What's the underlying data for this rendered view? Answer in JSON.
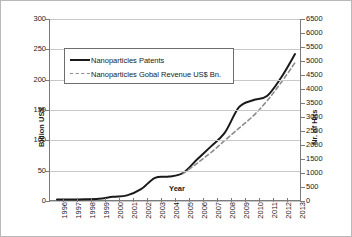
{
  "chart_data": {
    "type": "line",
    "title": "",
    "xlabel": "Year",
    "ylabel": "Billion US$",
    "y2label": "Nr. of Hits",
    "grid": true,
    "legend_position": "upper-left-inside",
    "categories": [
      "1996",
      "1997",
      "1998",
      "1999",
      "2000",
      "2001",
      "2002",
      "2003",
      "2004",
      "2005",
      "2006",
      "2007",
      "2008",
      "2009",
      "2010",
      "2011",
      "2012",
      "2013"
    ],
    "ylim": [
      0,
      300
    ],
    "yticks": [
      0,
      50,
      100,
      150,
      200,
      250,
      300
    ],
    "y2lim": [
      0,
      6500
    ],
    "y2ticks": [
      0,
      500,
      1000,
      1500,
      2000,
      2500,
      3000,
      3500,
      4000,
      4500,
      5000,
      5500,
      6000,
      6500
    ],
    "series": [
      {
        "name": "Nanoparticles Patents",
        "axis": "right",
        "units": "Nr. of Hits",
        "style": "solid",
        "color": "#1a1a1a",
        "values": [
          50,
          55,
          60,
          80,
          150,
          200,
          420,
          830,
          870,
          1000,
          1480,
          1950,
          2450,
          3350,
          3600,
          3750,
          4400,
          5250
        ]
      },
      {
        "name": "Nanoparticles Gobal Revenue US$ Bn.",
        "axis": "left",
        "units": "Billion US$",
        "style": "dashed",
        "color": "#8a8a8a",
        "values": [
          0,
          0,
          0,
          0,
          0,
          0,
          0,
          0,
          0,
          45,
          62,
          80,
          100,
          120,
          140,
          165,
          195,
          228
        ]
      }
    ]
  },
  "axes": {
    "left": {
      "title": "Billion US$",
      "ticks": [
        "300",
        "250",
        "200",
        "150",
        "100",
        "50",
        "0"
      ]
    },
    "right": {
      "title": "Nr. of Hits",
      "ticks": [
        "6500",
        "6000",
        "5500",
        "5000",
        "4500",
        "4000",
        "3500",
        "3000",
        "2500",
        "2000",
        "1500",
        "1000",
        "500",
        "0"
      ]
    },
    "bottom": {
      "title": "Year",
      "ticks": [
        "1996",
        "1997",
        "1998",
        "1999",
        "2000",
        "2001",
        "2002",
        "2003",
        "2004",
        "2005",
        "2006",
        "2007",
        "2008",
        "2009",
        "2010",
        "2011",
        "2012",
        "2013"
      ]
    }
  },
  "legend": {
    "items": [
      {
        "label": "Nanoparticles Patents",
        "style": "solid"
      },
      {
        "label": "Nanoparticles Gobal Revenue US$ Bn.",
        "style": "dashed"
      }
    ]
  },
  "colors": {
    "series_solid": "#1a1a1a",
    "series_dashed": "#8a8a8a",
    "gridline": "#c8c8c8",
    "axis": "#7b7b7b",
    "text": "#1a1a1a",
    "background": "#ffffff"
  }
}
